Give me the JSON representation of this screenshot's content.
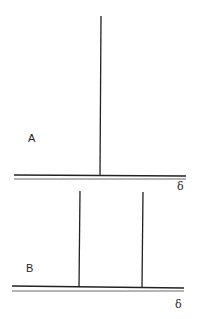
{
  "panels": [
    {
      "label": "A",
      "axis_label": "δ",
      "peaks": [
        {
          "x": 101,
          "top": 16
        }
      ],
      "baseline_y": 175
    },
    {
      "label": "B",
      "axis_label": "δ",
      "peaks": [
        {
          "x": 79,
          "top": 191
        },
        {
          "x": 142,
          "top": 192
        }
      ],
      "baseline_y": 287
    }
  ],
  "colors": {
    "line": "#222222"
  }
}
